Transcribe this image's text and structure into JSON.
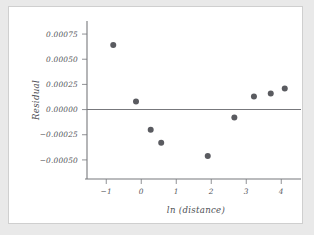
{
  "page": {
    "background_color": "#e9e9e9",
    "panel_color": "#ffffff",
    "panel_border_color": "#cfcfcf"
  },
  "chart_data": {
    "type": "scatter",
    "title": "",
    "xlabel": "ln (distance)",
    "ylabel": "Residual",
    "xlim": [
      -1.55,
      4.45
    ],
    "ylim": [
      -0.00063,
      0.00082
    ],
    "xticks": [
      -1,
      0,
      1,
      2,
      3,
      4
    ],
    "xtick_labels": [
      "−1",
      "0",
      "1",
      "2",
      "3",
      "4"
    ],
    "yticks": [
      0.00075,
      0.0005,
      0.00025,
      0.0,
      -0.00025,
      -0.0005
    ],
    "ytick_labels": [
      "0.00075",
      "0.00050",
      "0.00025",
      "0.00000",
      "−0.00025",
      "−0.00050"
    ],
    "grid": false,
    "legend": false,
    "reference_line": {
      "orientation": "horizontal",
      "y": 0.0,
      "color": "#77787c"
    },
    "marker": {
      "shape": "circle",
      "color": "#5a5b60",
      "size": 3.0
    },
    "points": [
      {
        "x": -0.8,
        "y": 0.00064
      },
      {
        "x": -0.15,
        "y": 8e-05
      },
      {
        "x": 0.27,
        "y": -0.0002
      },
      {
        "x": 0.57,
        "y": -0.00033
      },
      {
        "x": 1.9,
        "y": -0.00046
      },
      {
        "x": 2.66,
        "y": -8e-05
      },
      {
        "x": 3.22,
        "y": 0.00013
      },
      {
        "x": 3.7,
        "y": 0.00016
      },
      {
        "x": 4.1,
        "y": 0.00021
      }
    ],
    "x": [
      -0.8,
      -0.15,
      0.27,
      0.57,
      1.9,
      2.66,
      3.22,
      3.7,
      4.1
    ],
    "values": [
      0.00064,
      8e-05,
      -0.0002,
      -0.00033,
      -0.00046,
      -8e-05,
      0.00013,
      0.00016,
      0.00021
    ]
  }
}
